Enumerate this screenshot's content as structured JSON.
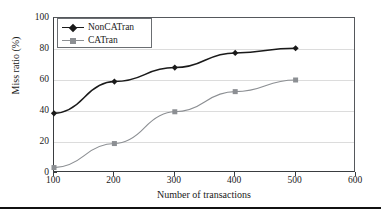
{
  "chart_data": {
    "type": "line",
    "title": "",
    "xlabel": "Number of transactions",
    "ylabel": "Miss ratio (%)",
    "x": [
      100,
      200,
      300,
      400,
      500
    ],
    "xlim": [
      100,
      600
    ],
    "ylim": [
      0,
      100
    ],
    "xticks": [
      100,
      200,
      300,
      400,
      500,
      600
    ],
    "yticks": [
      0,
      20,
      40,
      60,
      80,
      100
    ],
    "grid": "horizontal",
    "legend_position": "upper-left",
    "series": [
      {
        "name": "NonCATran",
        "values": [
          38.5,
          59,
          68,
          77.5,
          80.5
        ],
        "color": "#1a1a1a",
        "marker": "diamond"
      },
      {
        "name": "CATran",
        "values": [
          3.5,
          19,
          39.5,
          52.5,
          60
        ],
        "color": "#8c8f93",
        "marker": "square"
      }
    ]
  },
  "axes": {
    "x_tick_labels": [
      "100",
      "200",
      "300",
      "400",
      "500",
      "600"
    ],
    "y_tick_labels": [
      "0",
      "20",
      "40",
      "60",
      "80",
      "100"
    ],
    "x_title": "Number of transactions",
    "y_title": "Miss ratio (%)"
  },
  "legend": {
    "entries": [
      {
        "label": "NonCATran"
      },
      {
        "label": "CATran"
      }
    ]
  }
}
